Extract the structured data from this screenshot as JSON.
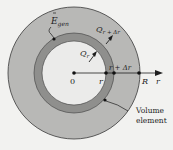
{
  "diagram": {
    "colors": {
      "background": "#f2f2f0",
      "outer_region": "#b8b8b6",
      "shell_ring": "#8f8f8d",
      "inner_region": "#ebebea",
      "stroke": "#3a3a3a",
      "ink": "#1e1e1e"
    },
    "labels": {
      "egen": "E",
      "egen_sub": "gen",
      "q_r": "Q",
      "q_r_sub": "r",
      "q_rdr": "Q",
      "q_rdr_sub": "r + Δr",
      "origin": "0",
      "r": "r",
      "r_plus_dr": "r + Δr",
      "R": "R",
      "axis": "r",
      "volume_line1": "Volume",
      "volume_line2": "element"
    }
  }
}
